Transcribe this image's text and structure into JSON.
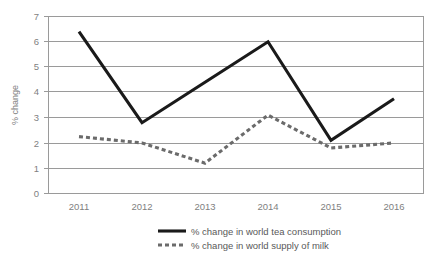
{
  "chart_data": {
    "type": "line",
    "title": "",
    "xlabel": "",
    "ylabel": "% change",
    "categories": [
      "2011",
      "2012",
      "2013",
      "2014",
      "2015",
      "2016"
    ],
    "ylim": [
      0,
      7
    ],
    "ytick_step": 1,
    "yticks": [
      "0",
      "1",
      "2",
      "3",
      "4",
      "5",
      "6",
      "7"
    ],
    "grid": true,
    "legend_position": "bottom",
    "series": [
      {
        "name": "% change in world tea consumption",
        "style": "solid",
        "color": "#1a1a1a",
        "values": [
          6.4,
          2.8,
          4.4,
          6.0,
          2.1,
          3.75
        ]
      },
      {
        "name": "% change in world supply of milk",
        "style": "dashed",
        "color": "#6b6b6b",
        "values": [
          2.25,
          2.0,
          1.2,
          3.1,
          1.8,
          2.0
        ]
      }
    ]
  },
  "axis": {
    "y_title": "% change",
    "y_tick_0": "0",
    "y_tick_1": "1",
    "y_tick_2": "2",
    "y_tick_3": "3",
    "y_tick_4": "4",
    "y_tick_5": "5",
    "y_tick_6": "6",
    "y_tick_7": "7",
    "x_tick_0": "2011",
    "x_tick_1": "2012",
    "x_tick_2": "2013",
    "x_tick_3": "2014",
    "x_tick_4": "2015",
    "x_tick_5": "2016"
  },
  "legend": {
    "item_0_label": "% change in world tea consumption",
    "item_1_label": "% change in world supply of milk"
  }
}
